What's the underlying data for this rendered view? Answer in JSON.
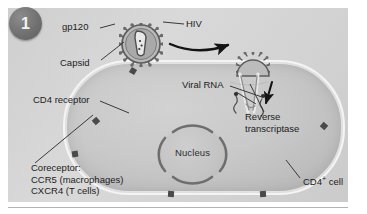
{
  "figure": {
    "step_number": "1",
    "type": "biology-diagram"
  },
  "labels": {
    "gp120": "gp120",
    "capsid": "Capsid",
    "hiv": "HIV",
    "viral_rna": "Viral RNA",
    "reverse_transcriptase_line1": "Reverse",
    "reverse_transcriptase_line2": "transcriptase",
    "cd4_receptor": "CD4 receptor",
    "coreceptor_line1": "Coreceptor:",
    "coreceptor_line2": "CCR5 (macrophages)",
    "coreceptor_line3": "CXCR4 (T cells)",
    "nucleus": "Nucleus",
    "cd4_cell_text": "CD4",
    "cd4_cell_sup": "+",
    "cd4_cell_tail": " cell"
  },
  "icons": {
    "virion_free": "hiv-virion-icon",
    "virion_fusing": "hiv-virion-fusing-icon",
    "nucleus": "nucleus-icon",
    "arrow_entry": "curved-arrow-icon",
    "arrow_rna": "down-arrow-icon",
    "receptor": "membrane-receptor-icon",
    "badge": "step-number-badge"
  },
  "colors": {
    "panel_background": "#d6d6d6",
    "cell_fill": "#c9c9c9",
    "membrane": "#f4f4f4",
    "receptor": "#4a4a4a",
    "badge": "#717171",
    "text": "#1c1c1c",
    "leader_line": "#3a3a3a"
  }
}
